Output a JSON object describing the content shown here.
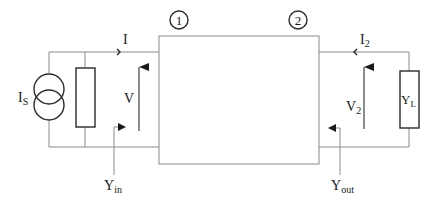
{
  "diagram": {
    "ports": [
      {
        "id": "port-1",
        "label": "1"
      },
      {
        "id": "port-2",
        "label": "2"
      }
    ],
    "source": {
      "label_main": "I",
      "label_sub": "S",
      "type": "current-source"
    },
    "input": {
      "current_label": "I",
      "voltage_label": "V",
      "admittance_main": "Y",
      "admittance_sub": "in"
    },
    "output": {
      "current_main": "I",
      "current_sub": "2",
      "voltage_main": "V",
      "voltage_sub": "2",
      "admittance_main": "Y",
      "admittance_sub": "out"
    },
    "load": {
      "label_main": "Y",
      "label_sub": "L"
    },
    "colors": {
      "wire": "#8a8a8a",
      "component": "#2a2a2a",
      "text": "#1a1a1a",
      "background": "#ffffff"
    }
  }
}
